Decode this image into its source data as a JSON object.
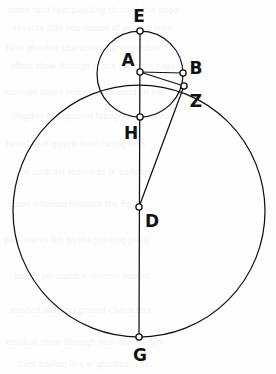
{
  "figure": {
    "width": 276,
    "height": 374,
    "background_color": "#fefefe",
    "ink_color": "#111111"
  },
  "circles": [
    {
      "name": "large-circle",
      "center_label": "D",
      "cx": 139,
      "cy": 211,
      "r": 126
    },
    {
      "name": "small-circle",
      "center_label": "A",
      "cx": 140,
      "cy": 74,
      "r": 43
    }
  ],
  "points": [
    {
      "id": "E",
      "label": "E",
      "x": 140,
      "y": 31,
      "label_x": 139,
      "label_y": 22,
      "label_anchor": "middle"
    },
    {
      "id": "A",
      "label": "A",
      "x": 140,
      "y": 72,
      "label_x": 128,
      "label_y": 66,
      "label_anchor": "middle"
    },
    {
      "id": "B",
      "label": "B",
      "x": 183,
      "y": 73,
      "label_x": 196,
      "label_y": 74,
      "label_anchor": "middle"
    },
    {
      "id": "Z",
      "label": "Z",
      "x": 184,
      "y": 86,
      "label_x": 196,
      "label_y": 107,
      "label_anchor": "middle"
    },
    {
      "id": "H",
      "label": "H",
      "x": 140,
      "y": 117,
      "label_x": 131,
      "label_y": 139,
      "label_anchor": "middle"
    },
    {
      "id": "D",
      "label": "D",
      "x": 139,
      "y": 207,
      "label_x": 152,
      "label_y": 227,
      "label_anchor": "middle"
    },
    {
      "id": "G",
      "label": "G",
      "x": 139,
      "y": 337,
      "label_x": 140,
      "label_y": 361,
      "label_anchor": "middle"
    }
  ],
  "segments": [
    {
      "name": "segment-E-G",
      "from": "E",
      "to": "G"
    },
    {
      "name": "segment-A-B",
      "from": "A",
      "to": "B"
    },
    {
      "name": "segment-A-Z",
      "from": "A",
      "to": "Z"
    },
    {
      "name": "segment-Z-D",
      "from": "Z",
      "to": "D"
    }
  ],
  "bleed_text": [
    {
      "text": "some faint text bleeding through the page",
      "x": 8,
      "y": 6
    },
    {
      "text": "reverse side impression of printed lines",
      "x": 14,
      "y": 24
    },
    {
      "text": "faint ghosted characters barely visible",
      "x": 6,
      "y": 44
    },
    {
      "text": "offset show-through of the opposite page",
      "x": 10,
      "y": 62
    },
    {
      "text": "scanned paper texture with residual ink",
      "x": 4,
      "y": 88
    },
    {
      "text": "illegible background typography traces",
      "x": 12,
      "y": 112
    },
    {
      "text": "faded serif glyphs from facing folio",
      "x": 6,
      "y": 140
    },
    {
      "text": "low contrast remnants of body text",
      "x": 16,
      "y": 168
    },
    {
      "text": "ghost lettering beneath the figure",
      "x": 8,
      "y": 200
    },
    {
      "text": "pale marks left by the printing press",
      "x": 4,
      "y": 236
    },
    {
      "text": "barely perceptible reverse imprint",
      "x": 14,
      "y": 272
    },
    {
      "text": "washed out background characters",
      "x": 10,
      "y": 306
    },
    {
      "text": "residual show-through near the margin",
      "x": 6,
      "y": 338
    },
    {
      "text": "faint trailing line of ghosted text",
      "x": 18,
      "y": 360
    }
  ]
}
